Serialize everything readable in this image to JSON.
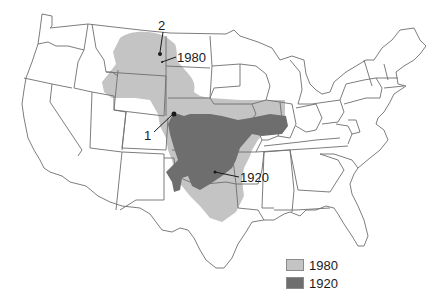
{
  "map": {
    "title": "",
    "region": "Contiguous United States",
    "colors": {
      "range_1980": "#c4c4c4",
      "range_1920": "#6e6e6e",
      "borders": "#6e6e6e",
      "background": "#ffffff"
    },
    "annotations": [
      {
        "id": "point-2",
        "text": "2"
      },
      {
        "id": "label-1980",
        "text": "1980"
      },
      {
        "id": "point-1",
        "text": "1"
      },
      {
        "id": "label-1920",
        "text": "1920"
      }
    ]
  },
  "legend": {
    "items": [
      {
        "label": "1980",
        "color": "#c4c4c4"
      },
      {
        "label": "1920",
        "color": "#6e6e6e"
      }
    ]
  }
}
